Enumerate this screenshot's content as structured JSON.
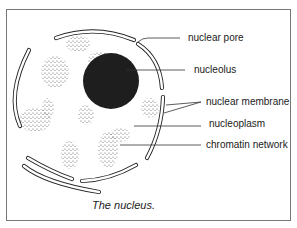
{
  "diagram": {
    "caption": "The nucleus.",
    "labels": {
      "nuclear_pore": "nuclear pore",
      "nucleolus": "nucleolus",
      "nuclear_membrane": "nuclear membrane",
      "nucleoplasm": "nucleoplasm",
      "chromatin_network": "chromatin network"
    },
    "colors": {
      "ink": "#222222",
      "frame": "#777777",
      "nucleolus": "#1e1e1e"
    }
  }
}
